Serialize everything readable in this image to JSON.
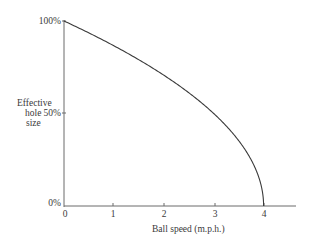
{
  "chart_data": {
    "type": "line",
    "title": "",
    "xlabel": "Ball speed (m.p.h.)",
    "ylabel": [
      "Effective",
      "hole",
      "size"
    ],
    "x_ticks": [
      "0",
      "1",
      "2",
      "3",
      "4"
    ],
    "y_ticks": [
      "0%",
      "50%",
      "100%"
    ],
    "xlim": [
      0,
      4.6
    ],
    "ylim": [
      0,
      100
    ],
    "grid": false,
    "legend": null,
    "series": [
      {
        "name": "Effective hole size",
        "x": [
          0,
          0.5,
          1,
          1.5,
          2,
          2.5,
          3,
          3.25,
          3.5,
          3.75,
          3.9,
          4
        ],
        "values": [
          100,
          93.5,
          86.6,
          79.1,
          70.7,
          61.2,
          50,
          43.3,
          35.4,
          25,
          15.8,
          0
        ]
      }
    ]
  },
  "colors": {
    "axis": "#6a6a6a",
    "curve": "#3a3a3a",
    "text": "#3a3a3a"
  }
}
